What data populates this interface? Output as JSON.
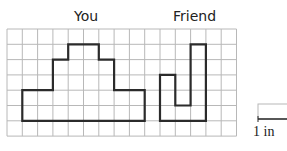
{
  "labels": {
    "you": "You",
    "friend": "Friend",
    "key": "1 in"
  },
  "grid": {
    "cols": 15,
    "rows": 7,
    "origin_x": 7,
    "origin_y": 29,
    "cell": 15.3,
    "line_color": "#b8b8b8",
    "shape_color": "#2b2b2b"
  },
  "shapes": {
    "you": [
      [
        1,
        6
      ],
      [
        1,
        4
      ],
      [
        3,
        4
      ],
      [
        3,
        2
      ],
      [
        4,
        2
      ],
      [
        4,
        1
      ],
      [
        6,
        1
      ],
      [
        6,
        2
      ],
      [
        7,
        2
      ],
      [
        7,
        4
      ],
      [
        9,
        4
      ],
      [
        9,
        6
      ]
    ],
    "friend": [
      [
        10,
        6
      ],
      [
        10,
        3
      ],
      [
        11,
        3
      ],
      [
        11,
        5
      ],
      [
        12,
        5
      ],
      [
        12,
        1
      ],
      [
        13,
        1
      ],
      [
        13,
        6
      ]
    ]
  }
}
